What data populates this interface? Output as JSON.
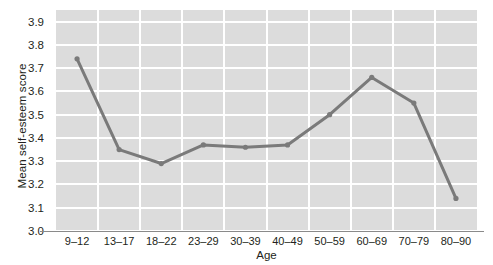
{
  "chart_data": {
    "type": "line",
    "title": "",
    "xlabel": "Age",
    "ylabel": "Mean self-esteem score",
    "categories": [
      "9–12",
      "13–17",
      "18–22",
      "23–29",
      "30–39",
      "40–49",
      "50–59",
      "60–69",
      "70–79",
      "80–90"
    ],
    "values": [
      3.74,
      3.35,
      3.29,
      3.37,
      3.36,
      3.37,
      3.5,
      3.66,
      3.55,
      3.14
    ],
    "series": [
      {
        "name": "Mean self-esteem score",
        "values": [
          3.74,
          3.35,
          3.29,
          3.37,
          3.36,
          3.37,
          3.5,
          3.66,
          3.55,
          3.14
        ]
      }
    ],
    "ylim": [
      3.0,
      3.95
    ],
    "yticks": [
      3.0,
      3.1,
      3.2,
      3.3,
      3.4,
      3.5,
      3.6,
      3.7,
      3.8,
      3.9
    ],
    "ytick_labels": [
      "3.0",
      "3.1",
      "3.2",
      "3.3",
      "3.4",
      "3.5",
      "3.6",
      "3.7",
      "3.8",
      "3.9"
    ],
    "grid": true,
    "grid_color": "#ffffff",
    "plot_background": "#dcdcdc",
    "line_color": "#7a7a7a",
    "marker_color": "#7a7a7a",
    "legend": null,
    "legend_position": "none",
    "markers": true,
    "annotations": []
  }
}
